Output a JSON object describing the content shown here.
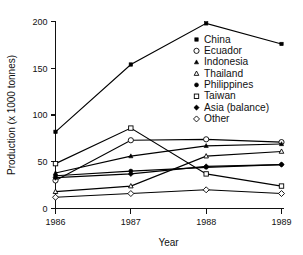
{
  "chart_data": {
    "type": "line",
    "title": "",
    "xlabel": "Year",
    "ylabel": "Production (x 1000 tonnes)",
    "x": [
      1986,
      1987,
      1988,
      1989
    ],
    "xtick_labels": [
      "1986",
      "1987",
      "1988",
      "1989"
    ],
    "ytick_labels": [
      "0",
      "50",
      "100",
      "150",
      "200"
    ],
    "yticks": [
      0,
      50,
      100,
      150,
      200
    ],
    "ylim": [
      0,
      200
    ],
    "xlim": [
      1986,
      1989
    ],
    "grid": false,
    "legend_position": "inside-upper-right",
    "series": [
      {
        "name": "China",
        "marker": "filled-square",
        "values": [
          82,
          154,
          198,
          176
        ]
      },
      {
        "name": "Ecuador",
        "marker": "open-circle",
        "values": [
          30,
          73,
          74,
          71
        ]
      },
      {
        "name": "Indonesia",
        "marker": "filled-triangle",
        "values": [
          38,
          56,
          67,
          69
        ]
      },
      {
        "name": "Thailand",
        "marker": "open-triangle",
        "values": [
          18,
          24,
          56,
          61
        ]
      },
      {
        "name": "Philippines",
        "marker": "filled-circle",
        "values": [
          35,
          40,
          44,
          47
        ]
      },
      {
        "name": "Taiwan",
        "marker": "open-square",
        "values": [
          48,
          86,
          37,
          24
        ]
      },
      {
        "name": "Asia (balance)",
        "marker": "filled-diamond",
        "values": [
          33,
          37,
          45,
          47
        ]
      },
      {
        "name": "Other",
        "marker": "open-diamond",
        "values": [
          12,
          16,
          20,
          16
        ]
      }
    ]
  },
  "legend": {
    "items": [
      {
        "label": "China",
        "marker": "filled-square"
      },
      {
        "label": "Ecuador",
        "marker": "open-circle"
      },
      {
        "label": "Indonesia",
        "marker": "filled-triangle"
      },
      {
        "label": "Thailand",
        "marker": "open-triangle"
      },
      {
        "label": "Philippines",
        "marker": "filled-circle"
      },
      {
        "label": "Taiwan",
        "marker": "open-square"
      },
      {
        "label": "Asia (balance)",
        "marker": "filled-diamond"
      },
      {
        "label": "Other",
        "marker": "open-diamond"
      }
    ]
  },
  "colors": {
    "ink": "#111111",
    "line": "#000000",
    "background": "#ffffff"
  }
}
